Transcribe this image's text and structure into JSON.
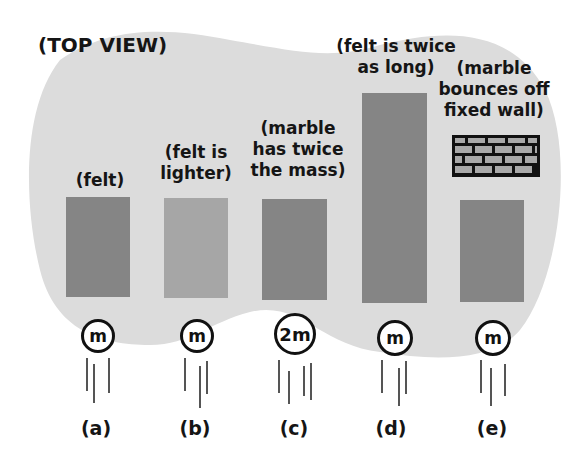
{
  "title": "(TOP VIEW)",
  "colors": {
    "region": "#dcdcdc",
    "felt": "#858585",
    "felt_light": "#a6a6a6",
    "brick": "#a9a9a9",
    "outline": "#111111"
  },
  "cases": [
    {
      "id": "a",
      "label": "(a)",
      "caption": [
        "(felt)"
      ],
      "marble": "m"
    },
    {
      "id": "b",
      "label": "(b)",
      "caption": [
        "(felt is",
        "lighter)"
      ],
      "marble": "m"
    },
    {
      "id": "c",
      "label": "(c)",
      "caption": [
        "(marble",
        "has twice",
        "the mass)"
      ],
      "marble": "2m"
    },
    {
      "id": "d",
      "label": "(d)",
      "caption": [
        "(felt is twice",
        "as long)"
      ],
      "marble": "m"
    },
    {
      "id": "e",
      "label": "(e)",
      "caption": [
        "(marble",
        "bounces off",
        "fixed wall)"
      ],
      "marble": "m"
    }
  ]
}
